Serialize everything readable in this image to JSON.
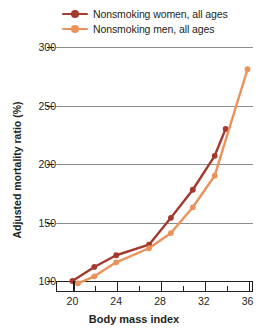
{
  "chart_data": {
    "type": "line",
    "title": "",
    "xlabel": "Body mass index",
    "ylabel": "Adjusted mortality ratio (%)",
    "xlim": [
      18.5,
      36.5
    ],
    "ylim": [
      90,
      305
    ],
    "xticks": [
      20,
      24,
      28,
      32,
      36
    ],
    "xtick_labels": [
      "20",
      "24",
      "28",
      "32",
      "36"
    ],
    "xminor_ticks": [
      22,
      26,
      30,
      34
    ],
    "yticks": [
      100,
      150,
      200,
      250,
      300
    ],
    "ytick_labels": [
      "100",
      "150",
      "200",
      "250",
      "300"
    ],
    "grid": "horizontal",
    "legend_position": "top",
    "series": [
      {
        "name": "Nonsmoking women, all ages",
        "color": "#a5392e",
        "marker": "circle",
        "points": [
          {
            "x": 20.0,
            "y": 100
          },
          {
            "x": 22.0,
            "y": 112
          },
          {
            "x": 24.0,
            "y": 122
          },
          {
            "x": 27.0,
            "y": 131
          },
          {
            "x": 29.0,
            "y": 154
          },
          {
            "x": 31.0,
            "y": 178
          },
          {
            "x": 33.0,
            "y": 207
          },
          {
            "x": 34.0,
            "y": 230
          }
        ]
      },
      {
        "name": "Nonsmoking men, all ages",
        "color": "#ec9159",
        "marker": "circle",
        "points": [
          {
            "x": 20.5,
            "y": 98
          },
          {
            "x": 22.0,
            "y": 104
          },
          {
            "x": 24.0,
            "y": 116
          },
          {
            "x": 27.0,
            "y": 128
          },
          {
            "x": 29.0,
            "y": 141
          },
          {
            "x": 31.0,
            "y": 163
          },
          {
            "x": 33.0,
            "y": 190
          },
          {
            "x": 36.0,
            "y": 281
          }
        ]
      }
    ]
  },
  "legend": {
    "items": [
      {
        "label": "Nonsmoking women, all ages",
        "color": "#a5392e"
      },
      {
        "label": "Nonsmoking men, all ages",
        "color": "#ec9159"
      }
    ]
  },
  "colors": {
    "women": "#a5392e",
    "men": "#ec9159",
    "gridline": "#8c8c8c",
    "axis": "#231f20",
    "text": "#231f20",
    "background": "#ffffff"
  }
}
